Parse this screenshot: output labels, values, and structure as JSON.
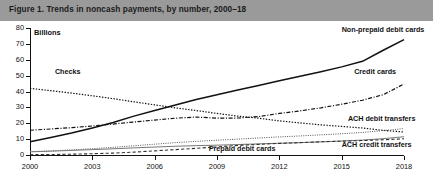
{
  "figure": {
    "title": "Figure 1. Trends in noncash payments, by number, 2000–18",
    "title_band_color": "#9a9a9a"
  },
  "chart_data": {
    "type": "line",
    "title": "Figure 1. Trends in noncash payments, by number, 2000–18",
    "xlabel": "",
    "ylabel": "Billions",
    "unit_label": "Billions",
    "xlim": [
      2000,
      2018
    ],
    "ylim": [
      0,
      80
    ],
    "grid": false,
    "legend_position": "inline-annotations",
    "x_ticks": [
      2000,
      2003,
      2006,
      2009,
      2012,
      2015,
      2018
    ],
    "x_tick_labels": [
      "2000",
      "2003",
      "2006",
      "2009",
      "2012",
      "2015",
      "2018"
    ],
    "y_ticks": [
      0,
      10,
      20,
      30,
      40,
      50,
      60,
      70,
      80
    ],
    "y_tick_labels": [
      "0",
      "10",
      "20",
      "30",
      "40",
      "50",
      "60",
      "70",
      "80"
    ],
    "x": [
      2000,
      2001,
      2002,
      2003,
      2004,
      2005,
      2006,
      2007,
      2008,
      2009,
      2010,
      2011,
      2012,
      2013,
      2014,
      2015,
      2016,
      2017,
      2018
    ],
    "series": [
      {
        "name": "Non-prepaid debit cards",
        "style": "solid",
        "width": 1.5,
        "color": "#111111",
        "label_x": 2015.0,
        "label_y": 79.0,
        "values": [
          8.3,
          11.0,
          13.8,
          17.0,
          20.5,
          24.5,
          28.0,
          31.5,
          34.9,
          38.0,
          41.0,
          43.8,
          46.8,
          49.6,
          52.5,
          55.5,
          59.0,
          66.0,
          72.7
        ]
      },
      {
        "name": "Checks",
        "style": "dotted",
        "width": 1.2,
        "color": "#111111",
        "label_x": 2001.2,
        "label_y": 52.0,
        "values": [
          42.0,
          40.5,
          39.0,
          37.3,
          35.5,
          33.5,
          31.6,
          29.7,
          28.0,
          26.2,
          24.5,
          23.2,
          21.5,
          20.2,
          19.0,
          18.0,
          17.0,
          15.5,
          14.5
        ]
      },
      {
        "name": "Credit cards",
        "style": "dashdot",
        "width": 1.2,
        "color": "#111111",
        "label_x": 2015.6,
        "label_y": 52.0,
        "values": [
          15.6,
          16.4,
          17.2,
          18.3,
          19.5,
          20.8,
          22.0,
          23.2,
          23.9,
          23.2,
          23.3,
          24.2,
          26.2,
          27.8,
          29.7,
          32.0,
          34.5,
          38.0,
          44.7
        ]
      },
      {
        "name": "ACH debit transfers",
        "style": "fine-dotted",
        "width": 1.0,
        "color": "#555555",
        "label_x": 2015.3,
        "label_y": 22.5,
        "values": [
          2.1,
          2.6,
          3.2,
          4.0,
          4.8,
          5.8,
          6.8,
          7.8,
          8.6,
          9.3,
          10.0,
          10.7,
          11.4,
          12.0,
          12.7,
          13.4,
          14.2,
          15.4,
          16.6
        ]
      },
      {
        "name": "ACH credit transfers",
        "style": "thin-solid",
        "width": 1.0,
        "color": "#777777",
        "label_x": 2015.0,
        "label_y": 6.0,
        "values": [
          2.0,
          2.4,
          2.9,
          3.4,
          3.9,
          4.5,
          5.0,
          5.5,
          5.9,
          6.2,
          6.6,
          7.0,
          7.4,
          7.8,
          8.3,
          8.8,
          9.4,
          10.3,
          11.5
        ]
      },
      {
        "name": "Prepaid debit cards",
        "style": "dashed",
        "width": 1.1,
        "color": "#333333",
        "label_x": 2008.6,
        "label_y": 4.0,
        "values": [
          0.2,
          0.3,
          0.5,
          0.8,
          1.2,
          1.8,
          2.6,
          3.4,
          4.2,
          5.1,
          6.0,
          6.7,
          7.3,
          7.8,
          8.3,
          8.7,
          9.1,
          9.6,
          10.2
        ]
      }
    ]
  }
}
